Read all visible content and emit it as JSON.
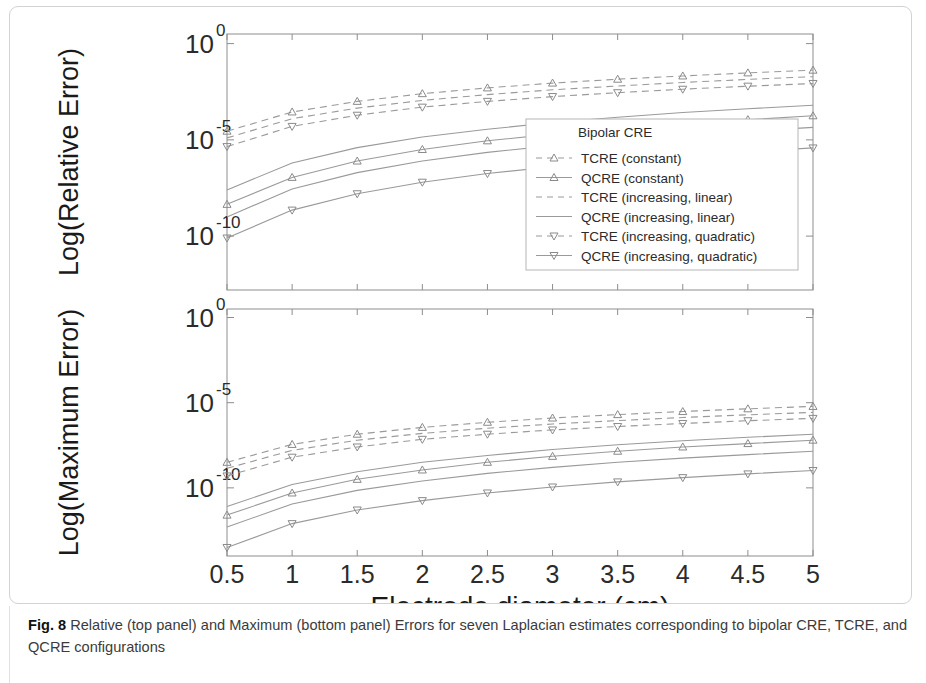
{
  "figure": {
    "caption_label": "Fig. 8",
    "caption_text": "Relative (top panel) and Maximum (bottom panel) Errors for seven Laplacian estimates corresponding to bipolar CRE, TCRE, and QCRE configurations"
  },
  "legend": {
    "title": "Bipolar CRE",
    "entries": [
      {
        "label": "TCRE (constant)",
        "style": "dashed",
        "marker": "triangle-up"
      },
      {
        "label": "QCRE (constant)",
        "style": "solid",
        "marker": "triangle-up"
      },
      {
        "label": "TCRE (increasing, linear)",
        "style": "dashed",
        "marker": "none"
      },
      {
        "label": "QCRE (increasing, linear)",
        "style": "solid",
        "marker": "none"
      },
      {
        "label": "TCRE (increasing, quadratic)",
        "style": "dashed",
        "marker": "triangle-down"
      },
      {
        "label": "QCRE (increasing, quadratic)",
        "style": "solid",
        "marker": "triangle-down"
      }
    ]
  },
  "chart_data": [
    {
      "id": "relative-error-panel",
      "type": "line",
      "title": "",
      "xlabel": "Electrode diameter (cm)",
      "ylabel": "Log(Relative Error)",
      "xticks": [
        "0.5",
        "1",
        "1.5",
        "2",
        "2.5",
        "3",
        "3.5",
        "4",
        "4.5",
        "5"
      ],
      "x": [
        0.5,
        1,
        1.5,
        2,
        2.5,
        3,
        3.5,
        4,
        4.5,
        5
      ],
      "xlim": [
        0.5,
        5
      ],
      "yticks": [
        "10^0",
        "10^-5",
        "10^-10"
      ],
      "ytick_exponents": [
        0,
        -5,
        -10
      ],
      "ylim_exponents": [
        -12.8,
        0.5
      ],
      "yscale": "log",
      "grid": false,
      "series": [
        {
          "name": "TCRE (constant)",
          "style": "dashed",
          "marker": "triangle-up",
          "log_values": [
            -4.55,
            -3.55,
            -3.0,
            -2.6,
            -2.3,
            -2.05,
            -1.85,
            -1.68,
            -1.52,
            -1.38
          ]
        },
        {
          "name": "QCRE (constant)",
          "style": "solid",
          "marker": "triangle-up",
          "log_values": [
            -8.35,
            -6.95,
            -6.1,
            -5.5,
            -5.05,
            -4.7,
            -4.4,
            -4.15,
            -3.95,
            -3.75
          ]
        },
        {
          "name": "TCRE (increasing, linear)",
          "style": "dashed",
          "marker": "none",
          "log_values": [
            -4.9,
            -3.9,
            -3.35,
            -2.95,
            -2.65,
            -2.4,
            -2.2,
            -2.02,
            -1.86,
            -1.72
          ]
        },
        {
          "name": "QCRE (increasing, linear)",
          "style": "solid",
          "marker": "none",
          "log_values": [
            -9.0,
            -7.55,
            -6.7,
            -6.1,
            -5.65,
            -5.3,
            -5.0,
            -4.75,
            -4.55,
            -4.35
          ]
        },
        {
          "name": "TCRE (increasing, quadratic)",
          "style": "dashed",
          "marker": "triangle-down",
          "log_values": [
            -5.35,
            -4.3,
            -3.72,
            -3.3,
            -3.0,
            -2.75,
            -2.55,
            -2.37,
            -2.21,
            -2.07
          ]
        },
        {
          "name": "QCRE (increasing, quadratic)",
          "style": "solid",
          "marker": "triangle-down",
          "log_values": [
            -10.1,
            -8.65,
            -7.8,
            -7.2,
            -6.75,
            -6.4,
            -6.1,
            -5.85,
            -5.62,
            -5.42
          ]
        },
        {
          "name": "Bipolar CRE",
          "style": "solid",
          "marker": "none",
          "log_values": [
            -7.6,
            -6.2,
            -5.4,
            -4.85,
            -4.45,
            -4.1,
            -3.82,
            -3.58,
            -3.38,
            -3.2
          ]
        }
      ]
    },
    {
      "id": "maximum-error-panel",
      "type": "line",
      "title": "",
      "xlabel": "Electrode diameter (cm)",
      "ylabel": "Log(Maximum Error)",
      "xticks": [
        "0.5",
        "1",
        "1.5",
        "2",
        "2.5",
        "3",
        "3.5",
        "4",
        "4.5",
        "5"
      ],
      "x": [
        0.5,
        1,
        1.5,
        2,
        2.5,
        3,
        3.5,
        4,
        4.5,
        5
      ],
      "xlim": [
        0.5,
        5
      ],
      "yticks": [
        "10^0",
        "10^-5",
        "10^-10"
      ],
      "ytick_exponents": [
        0,
        -5,
        -10
      ],
      "ylim_exponents": [
        -14.0,
        0.5
      ],
      "yscale": "log",
      "grid": false,
      "series": [
        {
          "name": "TCRE (constant)",
          "style": "dashed",
          "marker": "triangle-up",
          "log_values": [
            -8.5,
            -7.45,
            -6.85,
            -6.45,
            -6.15,
            -5.9,
            -5.7,
            -5.52,
            -5.36,
            -5.22
          ]
        },
        {
          "name": "QCRE (constant)",
          "style": "solid",
          "marker": "triangle-up",
          "log_values": [
            -11.6,
            -10.3,
            -9.5,
            -8.95,
            -8.5,
            -8.15,
            -7.85,
            -7.6,
            -7.4,
            -7.2
          ]
        },
        {
          "name": "TCRE (increasing, linear)",
          "style": "dashed",
          "marker": "none",
          "log_values": [
            -8.85,
            -7.8,
            -7.2,
            -6.8,
            -6.5,
            -6.25,
            -6.05,
            -5.87,
            -5.71,
            -5.57
          ]
        },
        {
          "name": "QCRE (increasing, linear)",
          "style": "solid",
          "marker": "none",
          "log_values": [
            -12.3,
            -10.95,
            -10.15,
            -9.6,
            -9.15,
            -8.8,
            -8.5,
            -8.25,
            -8.05,
            -7.85
          ]
        },
        {
          "name": "TCRE (increasing, quadratic)",
          "style": "dashed",
          "marker": "triangle-down",
          "log_values": [
            -9.3,
            -8.2,
            -7.6,
            -7.15,
            -6.85,
            -6.6,
            -6.4,
            -6.22,
            -6.06,
            -5.92
          ]
        },
        {
          "name": "QCRE (increasing, quadratic)",
          "style": "solid",
          "marker": "triangle-down",
          "log_values": [
            -13.5,
            -12.1,
            -11.3,
            -10.75,
            -10.3,
            -9.95,
            -9.65,
            -9.4,
            -9.18,
            -8.98
          ]
        },
        {
          "name": "Bipolar CRE",
          "style": "solid",
          "marker": "none",
          "log_values": [
            -11.1,
            -9.8,
            -9.05,
            -8.5,
            -8.1,
            -7.75,
            -7.47,
            -7.23,
            -7.03,
            -6.85
          ]
        }
      ]
    }
  ]
}
